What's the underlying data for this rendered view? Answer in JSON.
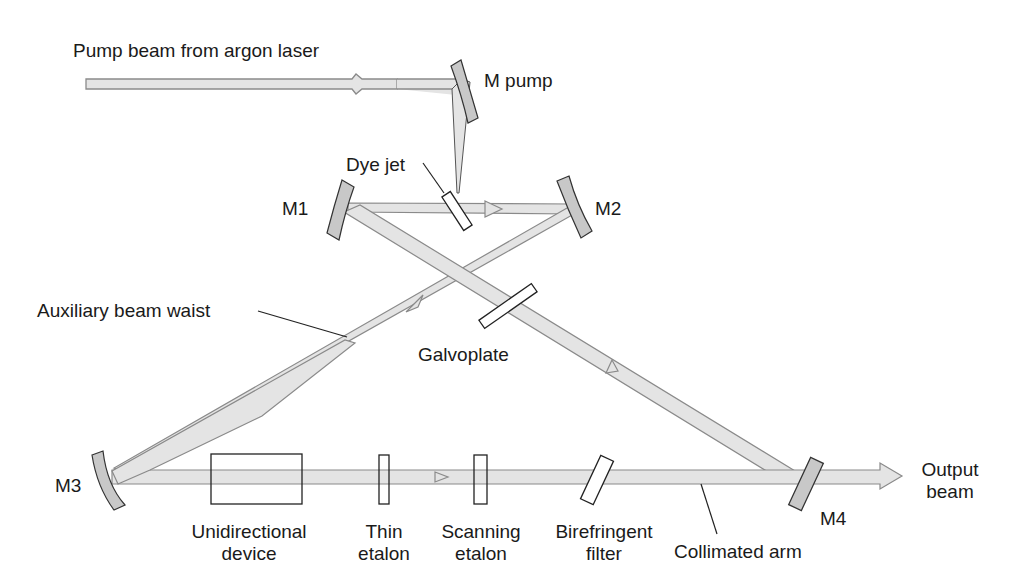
{
  "diagram": {
    "type": "ring dye laser cavity schematic",
    "colors": {
      "beam_fill": "#e4e4e4",
      "beam_stroke": "#8a8a8a",
      "mirror_fill": "#c8c8c8",
      "outline": "#222222",
      "text": "#1a1a1a"
    },
    "labels": {
      "pump_beam": "Pump beam from argon laser",
      "m_pump": "M pump",
      "dye_jet": "Dye jet",
      "m1": "M1",
      "m2": "M2",
      "m3": "M3",
      "m4": "M4",
      "aux_waist": "Auxiliary beam waist",
      "galvoplate": "Galvoplate",
      "unidirectional_1": "Unidirectional",
      "unidirectional_2": "device",
      "thin_1": "Thin",
      "thin_2": "etalon",
      "scanning_1": "Scanning",
      "scanning_2": "etalon",
      "biref_1": "Birefringent",
      "biref_2": "filter",
      "collimated": "Collimated arm",
      "output_1": "Output",
      "output_2": "beam"
    },
    "components": [
      "M pump",
      "Dye jet",
      "M1",
      "M2",
      "M3",
      "M4",
      "Galvoplate",
      "Unidirectional device",
      "Thin etalon",
      "Scanning etalon",
      "Birefringent filter"
    ]
  }
}
